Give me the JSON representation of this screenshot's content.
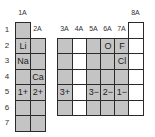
{
  "figure": "partial periodic table showing common ion charges",
  "group_labels": [
    "1A",
    "2A",
    "3A",
    "4A",
    "5A",
    "6A",
    "7A",
    "8A"
  ],
  "period_labels": [
    "1",
    "2",
    "3",
    "4",
    "5",
    "6",
    "7"
  ],
  "colors": {
    "shaded": "#c4c4c4",
    "unshaded": "#ffffff",
    "border": "#2a2a2a"
  },
  "cells": {
    "1A": {
      "shaded": true,
      "periods": [
        1,
        2,
        3,
        4,
        5,
        6,
        7
      ],
      "contents": {
        "2": "Li",
        "3": "Na",
        "5": "1+"
      }
    },
    "2A": {
      "shaded": true,
      "periods": [
        2,
        3,
        4,
        5,
        6,
        7
      ],
      "contents": {
        "4": "Ca",
        "5": "2+"
      }
    },
    "3A": {
      "shaded": true,
      "periods": [
        2,
        3,
        4,
        5,
        6
      ],
      "contents": {
        "5": "3+"
      }
    },
    "4A": {
      "shaded": false,
      "periods": [
        2,
        3,
        4,
        5,
        6
      ],
      "contents": {}
    },
    "5A": {
      "shaded": true,
      "periods": [
        2,
        3,
        4,
        5,
        6
      ],
      "contents": {
        "5": "3−"
      }
    },
    "6A": {
      "shaded": true,
      "periods": [
        2,
        3,
        4,
        5,
        6
      ],
      "contents": {
        "2": "O",
        "5": "2−"
      }
    },
    "7A": {
      "shaded": true,
      "periods": [
        2,
        3,
        4,
        5,
        6
      ],
      "contents": {
        "2": "F",
        "3": "Cl",
        "5": "1−"
      }
    },
    "8A": {
      "shaded": false,
      "periods": [
        1,
        2,
        3,
        4,
        5,
        6
      ],
      "contents": {}
    }
  }
}
